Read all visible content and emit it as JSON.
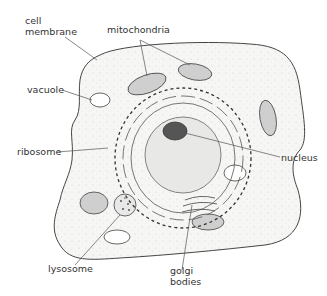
{
  "figure": {
    "labels": {
      "cell_membrane": "cell\nmembrane",
      "mitochondria": "mitochondria",
      "vacuole": "vacuole",
      "ribosome": "ribosome",
      "nucleus": "nucleus",
      "lysosome": "lysosome",
      "golgi_bodies": "golgi\nbodies"
    },
    "colors": {
      "line": "#444444",
      "cytoplasm": "#f4f4f2",
      "nucleus_fill": "#e6e6e6",
      "nucleolus": "#555555",
      "mito_fill": "#cfcfcf"
    }
  }
}
